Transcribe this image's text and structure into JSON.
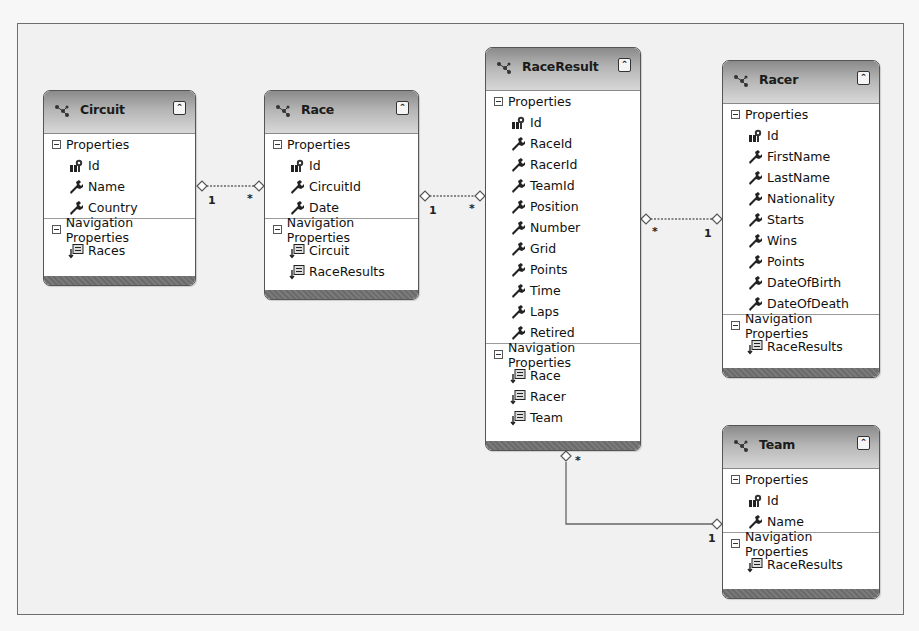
{
  "diagram": {
    "section_labels": {
      "properties": "Properties",
      "navigation": "Navigation Properties"
    },
    "collapse_glyph": "»",
    "entities": [
      {
        "name": "Circuit",
        "properties": [
          {
            "name": "Id",
            "key": true
          },
          {
            "name": "Name",
            "key": false
          },
          {
            "name": "Country",
            "key": false
          }
        ],
        "navigation": [
          "Races"
        ]
      },
      {
        "name": "Race",
        "properties": [
          {
            "name": "Id",
            "key": true
          },
          {
            "name": "CircuitId",
            "key": false
          },
          {
            "name": "Date",
            "key": false
          }
        ],
        "navigation": [
          "Circuit",
          "RaceResults"
        ]
      },
      {
        "name": "RaceResult",
        "properties": [
          {
            "name": "Id",
            "key": true
          },
          {
            "name": "RaceId",
            "key": false
          },
          {
            "name": "RacerId",
            "key": false
          },
          {
            "name": "TeamId",
            "key": false
          },
          {
            "name": "Position",
            "key": false
          },
          {
            "name": "Number",
            "key": false
          },
          {
            "name": "Grid",
            "key": false
          },
          {
            "name": "Points",
            "key": false
          },
          {
            "name": "Time",
            "key": false
          },
          {
            "name": "Laps",
            "key": false
          },
          {
            "name": "Retired",
            "key": false
          }
        ],
        "navigation": [
          "Race",
          "Racer",
          "Team"
        ]
      },
      {
        "name": "Racer",
        "properties": [
          {
            "name": "Id",
            "key": true
          },
          {
            "name": "FirstName",
            "key": false
          },
          {
            "name": "LastName",
            "key": false
          },
          {
            "name": "Nationality",
            "key": false
          },
          {
            "name": "Starts",
            "key": false
          },
          {
            "name": "Wins",
            "key": false
          },
          {
            "name": "Points",
            "key": false
          },
          {
            "name": "DateOfBirth",
            "key": false
          },
          {
            "name": "DateOfDeath",
            "key": false
          }
        ],
        "navigation": [
          "RaceResults"
        ]
      },
      {
        "name": "Team",
        "properties": [
          {
            "name": "Id",
            "key": true
          },
          {
            "name": "Name",
            "key": false
          }
        ],
        "navigation": [
          "RaceResults"
        ]
      }
    ],
    "associations": [
      {
        "from": "Circuit",
        "to": "Race",
        "from_mult": "1",
        "to_mult": "*"
      },
      {
        "from": "Race",
        "to": "RaceResult",
        "from_mult": "1",
        "to_mult": "*"
      },
      {
        "from": "RaceResult",
        "to": "Racer",
        "from_mult": "*",
        "to_mult": "1"
      },
      {
        "from": "RaceResult",
        "to": "Team",
        "from_mult": "*",
        "to_mult": "1"
      }
    ]
  }
}
